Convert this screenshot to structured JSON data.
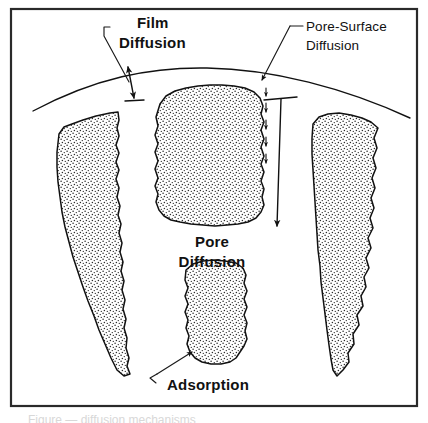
{
  "figure": {
    "frame": {
      "x": 10,
      "y": 8,
      "width": 408,
      "height": 399,
      "color": "#2a2a2a"
    },
    "background": "#ffffff",
    "ink_color": "#111111",
    "stipple_color": "#2b2b2b",
    "caption_partial": "Figure — diffusion mechanisms"
  },
  "labels": [
    {
      "id": "film-diffusion",
      "text_line_1": "Film",
      "text_line_2": "Diffusion",
      "x": 112,
      "y": 22,
      "style": "bold",
      "leader": "bent line from label down to double-headed arrow spanning the film gap"
    },
    {
      "id": "pore-surface-diffusion",
      "text_line_1": "Pore-Surface",
      "text_line_2": "Diffusion",
      "x": 305,
      "y": 20,
      "style": "regular",
      "leader": "diagonal line from label down-left to arrowhead at particle surface"
    },
    {
      "id": "pore-diffusion",
      "text_line_1": "Pore",
      "text_line_2": "Diffusion",
      "x": 212,
      "y": 238,
      "style": "bold",
      "leader": "none; long downward arrow in the pore channel to the right"
    },
    {
      "id": "adsorption",
      "text_line_1": "Adsorption",
      "text_line_2": "",
      "x": 196,
      "y": 389,
      "style": "bold",
      "leader": "hooked line from label up-right to arrowhead on lower particle"
    }
  ],
  "mechanisms": {
    "film_diffusion": "Transport of adsorbate across the liquid film surrounding the particle",
    "pore_surface_diffusion": "Migration of adsorbate along the internal pore surface",
    "pore_diffusion": "Diffusion of adsorbate through the fluid within the pore",
    "adsorption": "Attachment of adsorbate onto the adsorbent surface"
  },
  "geometry": {
    "outer_arc": {
      "description": "curved particle outer boundary",
      "left": [
        33,
        111
      ],
      "apex": [
        200,
        68
      ],
      "right": [
        410,
        118
      ]
    },
    "particles": [
      {
        "id": "left-wedge",
        "description": "tapering stippled wedge on the left"
      },
      {
        "id": "center-upper-blob",
        "description": "rounded stippled blob in the center top"
      },
      {
        "id": "center-lower-blob",
        "description": "stippled column at the center bottom"
      },
      {
        "id": "right-wedge",
        "description": "tapering stippled wedge on the right"
      }
    ],
    "arrows": [
      {
        "id": "film-gap-arrow",
        "type": "double-headed",
        "from": [
          129,
          63
        ],
        "to": [
          133,
          98
        ]
      },
      {
        "id": "pore-surface-arrowhead",
        "type": "single",
        "at": [
          262,
          84
        ]
      },
      {
        "id": "pore-surface-dashed-arrows",
        "type": "dashed-chain",
        "count": 5
      },
      {
        "id": "pore-diffusion-arrow",
        "type": "long-down",
        "from": [
          279,
          98
        ],
        "to": [
          278,
          225
        ]
      },
      {
        "id": "adsorption-arrow",
        "type": "single",
        "to": [
          192,
          357
        ]
      }
    ]
  }
}
